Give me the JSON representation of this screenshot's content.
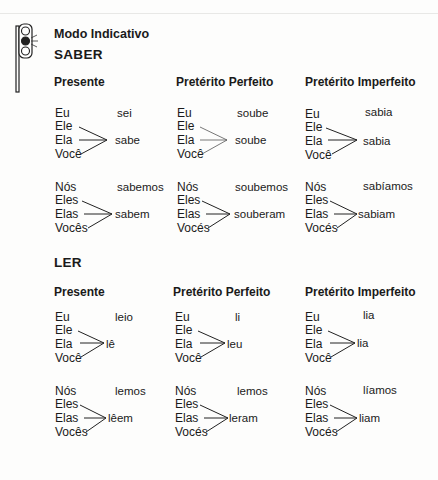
{
  "header": {
    "title": "Modo Indicativo",
    "icon": "traffic-light-icon"
  },
  "verbs": [
    {
      "name": "SABER",
      "tenses": [
        {
          "label": "Presente",
          "singular": {
            "eu": "Eu",
            "eu_form": "sei",
            "ele": "Ele",
            "ela": "Ela",
            "voce": "Você",
            "shared_form": "sabe"
          },
          "plural": {
            "nos": "Nós",
            "nos_form": "sabemos",
            "eles": "Eles",
            "elas": "Elas",
            "voces": "Vocês",
            "shared_form": "sabem"
          }
        },
        {
          "label": "Pretérito Perfeito",
          "singular": {
            "eu": "Eu",
            "eu_form": "soube",
            "ele": "Ele",
            "ela": "Ela",
            "voce": "Você",
            "shared_form": "soube"
          },
          "plural": {
            "nos": "Nós",
            "nos_form": "soubemos",
            "eles": "Eles",
            "elas": "Elas",
            "voces": "Vocés",
            "shared_form": "souberam"
          }
        },
        {
          "label": "Pretérito Imperfeito",
          "singular": {
            "eu": "Eu",
            "eu_form": "sabia",
            "ele": "Ele",
            "ela": "Ela",
            "voce": "Você",
            "shared_form": "sabia"
          },
          "plural": {
            "nos": "Nós",
            "nos_form": "sabíamos",
            "eles": "Eles",
            "elas": "Elas",
            "voces": "Vocés",
            "shared_form": "sabiam"
          }
        }
      ]
    },
    {
      "name": "LER",
      "tenses": [
        {
          "label": "Presente",
          "singular": {
            "eu": "Eu",
            "eu_form": "leio",
            "ele": "Ele",
            "ela": "Ela",
            "voce": "Você",
            "shared_form": "lê"
          },
          "plural": {
            "nos": "Nós",
            "nos_form": "lemos",
            "eles": "Eles",
            "elas": "Elas",
            "voces": "Vocês",
            "shared_form": "lêem"
          }
        },
        {
          "label": "Pretérito Perfeito",
          "singular": {
            "eu": "Eu",
            "eu_form": "li",
            "ele": "Ele",
            "ela": "Ela",
            "voce": "Você",
            "shared_form": "leu"
          },
          "plural": {
            "nos": "Nós",
            "nos_form": "lemos",
            "eles": "Eles",
            "elas": "Elas",
            "voces": "Vocés",
            "shared_form": "leram"
          }
        },
        {
          "label": "Pretérito Imperfeito",
          "singular": {
            "eu": "Eu",
            "eu_form": "lia",
            "ele": "Ele",
            "ela": "Ela",
            "voce": "Você",
            "shared_form": "lia"
          },
          "plural": {
            "nos": "Nós",
            "nos_form": "líamos",
            "eles": "Eles",
            "elas": "Elas",
            "voces": "Vocés",
            "shared_form": "liam"
          }
        }
      ]
    }
  ]
}
